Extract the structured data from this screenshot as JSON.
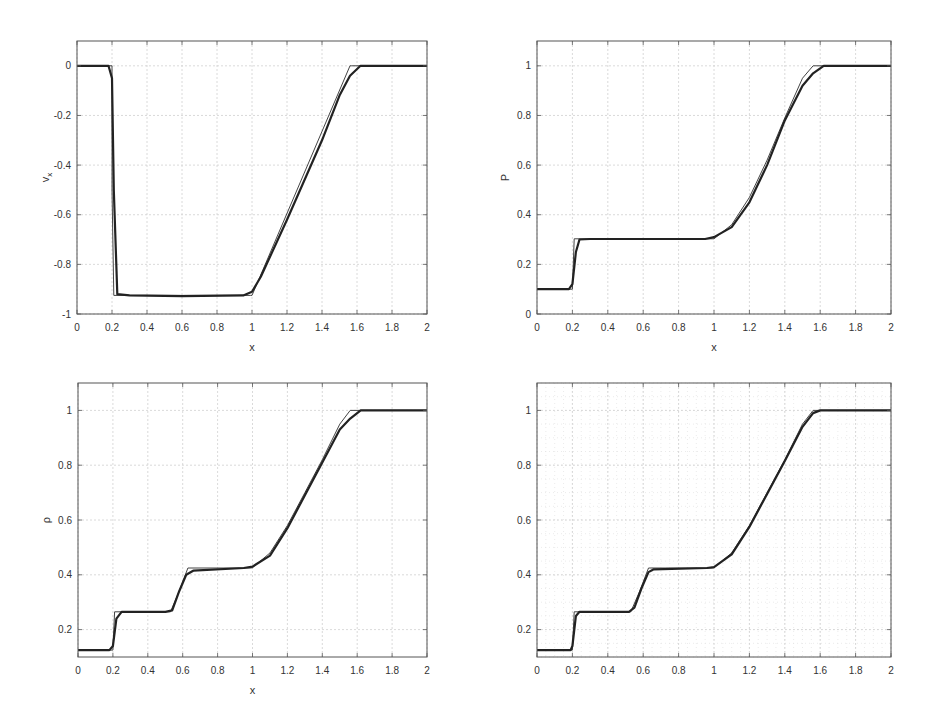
{
  "figure": {
    "panels": 4,
    "layout": "2x2"
  },
  "chart_data": [
    {
      "id": "top-left",
      "type": "line",
      "title": "",
      "xlabel": "x",
      "ylabel": "v_x",
      "xlim": [
        0,
        2
      ],
      "ylim": [
        -1,
        0.1
      ],
      "xticks": [
        0,
        0.2,
        0.4,
        0.6,
        0.8,
        1,
        1.2,
        1.4,
        1.6,
        1.8,
        2
      ],
      "xtick_labels": [
        "0",
        "0.2",
        "0.4",
        "0.6",
        "0.8",
        "1",
        "1.2",
        "1.4",
        "1.6",
        "1.8",
        "2"
      ],
      "yticks": [
        -1,
        -0.8,
        -0.6,
        -0.4,
        -0.2,
        0
      ],
      "ytick_labels": [
        "-1",
        "-0.8",
        "-0.6",
        "-0.4",
        "-0.2",
        "0"
      ],
      "grid": "major",
      "series": [
        {
          "name": "exact",
          "style": "thin",
          "x": [
            0,
            0.2,
            0.2,
            0.21,
            0.99,
            1.0,
            1.56,
            1.57,
            2
          ],
          "y": [
            0,
            0,
            -0.5,
            -0.925,
            -0.925,
            -0.925,
            0,
            0,
            0
          ]
        },
        {
          "name": "numerical",
          "style": "thick",
          "x": [
            0,
            0.18,
            0.2,
            0.21,
            0.23,
            0.3,
            0.6,
            0.95,
            1.0,
            1.05,
            1.2,
            1.4,
            1.5,
            1.56,
            1.62,
            2
          ],
          "y": [
            0,
            0,
            -0.05,
            -0.5,
            -0.92,
            -0.925,
            -0.928,
            -0.925,
            -0.91,
            -0.85,
            -0.62,
            -0.3,
            -0.12,
            -0.04,
            0,
            0
          ]
        }
      ]
    },
    {
      "id": "top-right",
      "type": "line",
      "title": "",
      "xlabel": "x",
      "ylabel": "P",
      "xlim": [
        0,
        2
      ],
      "ylim": [
        0,
        1.1
      ],
      "xticks": [
        0,
        0.2,
        0.4,
        0.6,
        0.8,
        1,
        1.2,
        1.4,
        1.6,
        1.8,
        2
      ],
      "xtick_labels": [
        "0",
        "0.2",
        "0.4",
        "0.6",
        "0.8",
        "1",
        "1.2",
        "1.4",
        "1.6",
        "1.8",
        "2"
      ],
      "yticks": [
        0,
        0.2,
        0.4,
        0.6,
        0.8,
        1
      ],
      "ytick_labels": [
        "0",
        "0.2",
        "0.4",
        "0.6",
        "0.8",
        "1"
      ],
      "grid": "major",
      "series": [
        {
          "name": "exact",
          "style": "thin",
          "x": [
            0,
            0.2,
            0.21,
            0.99,
            1.0,
            1.1,
            1.2,
            1.3,
            1.4,
            1.5,
            1.56,
            2
          ],
          "y": [
            0.1,
            0.1,
            0.303,
            0.303,
            0.303,
            0.36,
            0.47,
            0.62,
            0.79,
            0.95,
            1.0,
            1.0
          ]
        },
        {
          "name": "numerical",
          "style": "thick",
          "x": [
            0,
            0.18,
            0.2,
            0.22,
            0.24,
            0.3,
            0.6,
            0.95,
            1.0,
            1.1,
            1.2,
            1.3,
            1.4,
            1.5,
            1.56,
            1.62,
            2
          ],
          "y": [
            0.1,
            0.1,
            0.12,
            0.25,
            0.3,
            0.302,
            0.302,
            0.302,
            0.31,
            0.35,
            0.45,
            0.6,
            0.78,
            0.92,
            0.97,
            1.0,
            1.0
          ]
        }
      ]
    },
    {
      "id": "bottom-left",
      "type": "line",
      "title": "",
      "xlabel": "x",
      "ylabel": "ρ",
      "xlim": [
        0,
        2
      ],
      "ylim": [
        0.1,
        1.1
      ],
      "xticks": [
        0,
        0.2,
        0.4,
        0.6,
        0.8,
        1,
        1.2,
        1.4,
        1.6,
        1.8,
        2
      ],
      "xtick_labels": [
        "0",
        "0.2",
        "0.4",
        "0.6",
        "0.8",
        "1",
        "1.2",
        "1.4",
        "1.6",
        "1.8",
        "2"
      ],
      "yticks": [
        0.2,
        0.4,
        0.6,
        0.8,
        1
      ],
      "ytick_labels": [
        "0.2",
        "0.4",
        "0.6",
        "0.8",
        "1"
      ],
      "grid": "major",
      "series": [
        {
          "name": "exact",
          "style": "thin",
          "x": [
            0,
            0.2,
            0.21,
            0.53,
            0.58,
            0.63,
            0.99,
            1.0,
            1.1,
            1.2,
            1.3,
            1.4,
            1.5,
            1.56,
            2
          ],
          "y": [
            0.125,
            0.125,
            0.265,
            0.265,
            0.34,
            0.425,
            0.425,
            0.426,
            0.48,
            0.58,
            0.7,
            0.82,
            0.95,
            1.0,
            1.0
          ]
        },
        {
          "name": "numerical",
          "style": "thick",
          "x": [
            0,
            0.18,
            0.2,
            0.22,
            0.25,
            0.5,
            0.54,
            0.58,
            0.62,
            0.66,
            0.95,
            1.0,
            1.1,
            1.2,
            1.3,
            1.4,
            1.5,
            1.56,
            1.62,
            2
          ],
          "y": [
            0.125,
            0.125,
            0.14,
            0.24,
            0.265,
            0.265,
            0.27,
            0.34,
            0.4,
            0.415,
            0.425,
            0.43,
            0.47,
            0.57,
            0.69,
            0.81,
            0.93,
            0.97,
            1.0,
            1.0
          ]
        }
      ]
    },
    {
      "id": "bottom-right",
      "type": "line",
      "title": "",
      "xlabel": "",
      "ylabel": "",
      "xlim": [
        0,
        2
      ],
      "ylim": [
        0.1,
        1.1
      ],
      "xticks": [
        0,
        0.2,
        0.4,
        0.6,
        0.8,
        1,
        1.2,
        1.4,
        1.6,
        1.8,
        2
      ],
      "xtick_labels": [
        "0",
        "0.2",
        "0.4",
        "0.6",
        "0.8",
        "1",
        "1.2",
        "1.4",
        "1.6",
        "1.8",
        "2"
      ],
      "yticks": [
        0.2,
        0.4,
        0.6,
        0.8,
        1
      ],
      "ytick_labels": [
        "0.2",
        "0.4",
        "0.6",
        "0.8",
        "1"
      ],
      "grid": "major+minor",
      "series": [
        {
          "name": "exact",
          "style": "thin",
          "x": [
            0,
            0.2,
            0.21,
            0.53,
            0.58,
            0.63,
            0.99,
            1.0,
            1.1,
            1.2,
            1.3,
            1.4,
            1.5,
            1.56,
            2
          ],
          "y": [
            0.125,
            0.125,
            0.265,
            0.265,
            0.34,
            0.425,
            0.425,
            0.426,
            0.48,
            0.58,
            0.7,
            0.82,
            0.95,
            1.0,
            1.0
          ]
        },
        {
          "name": "numerical",
          "style": "thick",
          "x": [
            0,
            0.19,
            0.2,
            0.22,
            0.24,
            0.52,
            0.55,
            0.59,
            0.63,
            0.66,
            0.96,
            1.0,
            1.1,
            1.2,
            1.3,
            1.4,
            1.5,
            1.56,
            1.6,
            2
          ],
          "y": [
            0.125,
            0.125,
            0.14,
            0.25,
            0.265,
            0.265,
            0.28,
            0.35,
            0.41,
            0.42,
            0.425,
            0.428,
            0.475,
            0.575,
            0.695,
            0.815,
            0.94,
            0.99,
            1.0,
            1.0
          ]
        }
      ]
    }
  ],
  "layout_px": [
    {
      "left": 77,
      "top": 41,
      "right": 427,
      "bottom": 314
    },
    {
      "left": 537,
      "top": 41,
      "right": 891,
      "bottom": 314
    },
    {
      "left": 78,
      "top": 383,
      "right": 427,
      "bottom": 657
    },
    {
      "left": 537,
      "top": 383,
      "right": 891,
      "bottom": 657
    }
  ],
  "colors": {
    "axis": "#555555",
    "grid": "#d0d0d0",
    "minor_grid": "#dedede",
    "exact_line": "#444444",
    "numerical_line": "#222222",
    "tick_text": "#333333"
  }
}
